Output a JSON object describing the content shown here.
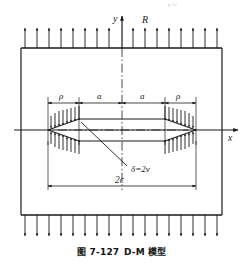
{
  "figure": {
    "caption_number": "图 7-127",
    "caption_title": "D-M 模型",
    "page_header_faint": "p.12",
    "axes": {
      "y_label": "y",
      "x_label": "x"
    },
    "labels": {
      "remote_stress": "R",
      "rho_left": "ρ",
      "a_left": "a",
      "a_right": "a",
      "rho_right": "ρ",
      "crack_opening": "δ=2v",
      "crack_length": "2c"
    },
    "colors": {
      "ink": "#1a1a1a",
      "background": "#ffffff",
      "faint": "#c9c9c9"
    },
    "geometry": {
      "plate_left": 21,
      "plate_right": 222,
      "plate_top": 48,
      "plate_bottom": 215,
      "crack_tip_left": 48,
      "crack_tip_right": 196,
      "crack_axis_y": 130,
      "crack_half_height": 11,
      "inner_left": 79,
      "inner_right": 165,
      "y_axis_x": 122,
      "top_load_arrows": 17,
      "bottom_load_arrows": 17,
      "cohesive_arrows_per_side": 8
    }
  }
}
